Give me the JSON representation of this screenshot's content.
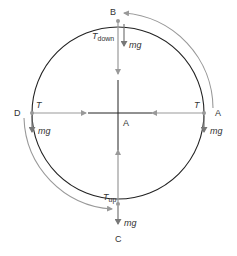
{
  "diagram": {
    "points": {
      "top": "B",
      "right": "A",
      "left": "D",
      "bottom": "C",
      "center": "A"
    },
    "forces": {
      "top_tension": "T",
      "top_tension_sub": "down",
      "bottom_tension": "T",
      "bottom_tension_sub": "up",
      "left_tension": "T",
      "right_tension": "T",
      "weight": "mg"
    },
    "colors": {
      "circle": "#222222",
      "arrow": "#999999",
      "text": "#333333"
    }
  }
}
